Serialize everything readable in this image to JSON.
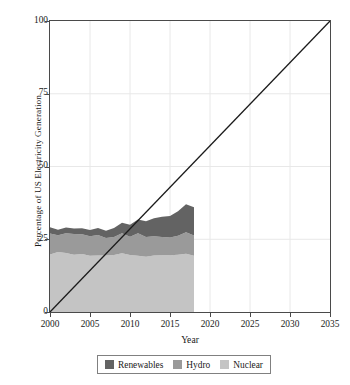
{
  "chart_data": {
    "type": "area",
    "title": "",
    "xlabel": "Year",
    "ylabel": "Percentage of US Electricity Generation",
    "xlim": [
      2000,
      2035
    ],
    "ylim": [
      0,
      100
    ],
    "xticks": [
      2000,
      2005,
      2010,
      2015,
      2020,
      2025,
      2030,
      2035
    ],
    "yticks": [
      0,
      25,
      50,
      75,
      100
    ],
    "xtick_labels": [
      "2000",
      "2005",
      "2010",
      "2015",
      "2020",
      "2025",
      "2030",
      "2035"
    ],
    "ytick_labels": [
      "0",
      "25",
      "50",
      "75",
      "100"
    ],
    "grid": true,
    "grid_color": "#e8e8e8",
    "legend_position": "bottom",
    "stacked": true,
    "stack_order": [
      "Nuclear",
      "Hydro",
      "Renewables"
    ],
    "x": [
      2000,
      2001,
      2002,
      2003,
      2004,
      2005,
      2006,
      2007,
      2008,
      2009,
      2010,
      2011,
      2012,
      2013,
      2014,
      2015,
      2016,
      2017,
      2018
    ],
    "series": [
      {
        "name": "Nuclear",
        "color": "#c4c4c4",
        "values": [
          19.8,
          20.6,
          20.3,
          19.7,
          19.9,
          19.3,
          19.4,
          19.4,
          19.6,
          20.2,
          19.6,
          19.3,
          19.0,
          19.4,
          19.5,
          19.5,
          19.7,
          20.0,
          19.3
        ]
      },
      {
        "name": "Hydro",
        "color": "#9a9a9a",
        "values": [
          7.2,
          5.8,
          6.8,
          7.1,
          6.8,
          6.7,
          7.1,
          6.0,
          6.2,
          6.9,
          6.3,
          7.8,
          6.8,
          6.6,
          6.3,
          6.1,
          6.5,
          7.4,
          7.0
        ]
      },
      {
        "name": "Renewables",
        "color": "#636363",
        "values": [
          2.1,
          1.9,
          1.9,
          1.9,
          2.1,
          2.2,
          2.4,
          2.5,
          3.1,
          3.6,
          4.1,
          4.7,
          5.4,
          6.2,
          6.9,
          7.4,
          8.4,
          9.6,
          9.7
        ]
      }
    ],
    "reference_line": {
      "name": "linear-target",
      "color": "#1a1a1a",
      "points": [
        [
          2000,
          0
        ],
        [
          2035,
          100
        ]
      ]
    }
  },
  "legend": {
    "items": [
      {
        "label": "Renewables",
        "color": "#636363"
      },
      {
        "label": "Hydro",
        "color": "#9a9a9a"
      },
      {
        "label": "Nuclear",
        "color": "#c4c4c4"
      }
    ]
  }
}
